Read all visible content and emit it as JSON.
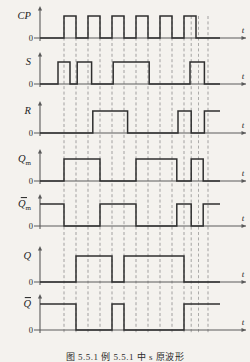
{
  "figure": {
    "type": "timing-diagram",
    "caption": "图 5.5.1   例 5.5.1 中 s 原波形",
    "background_color": "#f4f2ee",
    "trace_color": "#2f2f2f",
    "axis_color": "#5a5a5a",
    "grid_color": "#6e6e6e",
    "zero_label": "0",
    "time_label": "t",
    "width": 250,
    "height": 362
  },
  "chart_data": {
    "type": "line",
    "title": "图 5.5.1   例 5.5.1 中 s 原波形",
    "xlabel": "t",
    "ylabel": "",
    "xlim": [
      0,
      16
    ],
    "ylim": [
      0,
      1
    ],
    "grid": true,
    "legend_position": "none",
    "x_unit": "half clock period",
    "gridlines_x": [
      2,
      3,
      4,
      5,
      6,
      7,
      8,
      9,
      10,
      11,
      12,
      12.6,
      13.2,
      14
    ],
    "series": [
      {
        "name": "CP",
        "label": "CP",
        "overbar": false,
        "subscript": "",
        "steps": [
          [
            0,
            0
          ],
          [
            2,
            1
          ],
          [
            3,
            0
          ],
          [
            4,
            1
          ],
          [
            5,
            0
          ],
          [
            6,
            1
          ],
          [
            7,
            0
          ],
          [
            8,
            1
          ],
          [
            9,
            0
          ],
          [
            10,
            1
          ],
          [
            11,
            0
          ],
          [
            12,
            1
          ],
          [
            13,
            0
          ],
          [
            15,
            0
          ]
        ]
      },
      {
        "name": "S",
        "label": "S",
        "overbar": false,
        "subscript": "",
        "steps": [
          [
            0,
            0
          ],
          [
            1.5,
            1
          ],
          [
            2.5,
            0
          ],
          [
            2.9,
            0
          ],
          [
            3.1,
            1
          ],
          [
            4.3,
            1
          ],
          [
            4.3,
            0
          ],
          [
            6,
            0
          ],
          [
            6.1,
            1
          ],
          [
            9.1,
            1
          ],
          [
            9.1,
            0
          ],
          [
            12.4,
            0
          ],
          [
            12.5,
            1
          ],
          [
            13.7,
            1
          ],
          [
            13.7,
            0
          ],
          [
            15,
            0
          ]
        ]
      },
      {
        "name": "R",
        "label": "R",
        "overbar": false,
        "subscript": "",
        "steps": [
          [
            0,
            0
          ],
          [
            4.3,
            0
          ],
          [
            4.4,
            1
          ],
          [
            7.3,
            1
          ],
          [
            7.3,
            0
          ],
          [
            11.4,
            0
          ],
          [
            11.5,
            1
          ],
          [
            12.6,
            1
          ],
          [
            12.6,
            0
          ],
          [
            13.6,
            0
          ],
          [
            13.7,
            1
          ],
          [
            15,
            1
          ]
        ]
      },
      {
        "name": "Qm",
        "label": "Q",
        "overbar": false,
        "subscript": "m",
        "steps": [
          [
            0,
            0
          ],
          [
            2,
            0
          ],
          [
            2,
            1
          ],
          [
            5,
            1
          ],
          [
            5,
            0
          ],
          [
            8,
            0
          ],
          [
            8,
            1
          ],
          [
            11.4,
            1
          ],
          [
            11.4,
            0
          ],
          [
            12.6,
            0
          ],
          [
            12.6,
            1
          ],
          [
            13.6,
            1
          ],
          [
            13.6,
            0
          ],
          [
            15,
            0
          ]
        ]
      },
      {
        "name": "Qm_bar",
        "label": "Q",
        "overbar": true,
        "subscript": "m",
        "steps": [
          [
            0,
            1
          ],
          [
            2,
            1
          ],
          [
            2,
            0
          ],
          [
            5,
            0
          ],
          [
            5,
            1
          ],
          [
            8,
            1
          ],
          [
            8,
            0
          ],
          [
            11.4,
            0
          ],
          [
            11.4,
            1
          ],
          [
            12.6,
            1
          ],
          [
            12.6,
            0
          ],
          [
            13.6,
            0
          ],
          [
            13.6,
            1
          ],
          [
            15,
            1
          ]
        ]
      },
      {
        "name": "Q",
        "label": "Q",
        "overbar": false,
        "subscript": "",
        "steps": [
          [
            0,
            0
          ],
          [
            3,
            0
          ],
          [
            3,
            1
          ],
          [
            6,
            1
          ],
          [
            6,
            0
          ],
          [
            7,
            0
          ],
          [
            7,
            1
          ],
          [
            12,
            1
          ],
          [
            12,
            0
          ],
          [
            15,
            0
          ]
        ]
      },
      {
        "name": "Q_bar",
        "label": "Q",
        "overbar": true,
        "subscript": "",
        "steps": [
          [
            0,
            1
          ],
          [
            3,
            1
          ],
          [
            3,
            0
          ],
          [
            6,
            0
          ],
          [
            6,
            1
          ],
          [
            7,
            1
          ],
          [
            7,
            0
          ],
          [
            12,
            0
          ],
          [
            12,
            1
          ],
          [
            15,
            1
          ]
        ]
      }
    ]
  }
}
